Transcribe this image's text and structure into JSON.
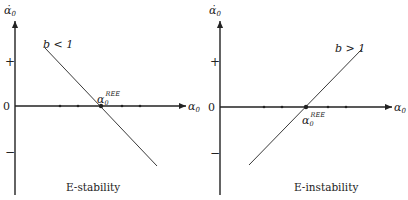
{
  "panels": [
    {
      "id": "left",
      "caption": "E-stability",
      "y_axis_label": "α̇",
      "y_axis_sub": "0",
      "x_axis_label": "α",
      "x_axis_sub": "0",
      "plus_label": "+",
      "zero_label": "0",
      "minus_label": "−",
      "line_label": "b < 1",
      "point_label_main": "α",
      "point_label_sub": "0",
      "point_label_sup": "REE"
    },
    {
      "id": "right",
      "caption": "E-instability",
      "y_axis_label": "α̇",
      "y_axis_sub": "0",
      "x_axis_label": "α",
      "x_axis_sub": "0",
      "plus_label": "+",
      "zero_label": "0",
      "minus_label": "−",
      "line_label": "b > 1",
      "point_label_main": "α",
      "point_label_sub": "0",
      "point_label_sup": "REE"
    }
  ],
  "colors": {
    "ink": "#222222",
    "background": "#ffffff"
  }
}
